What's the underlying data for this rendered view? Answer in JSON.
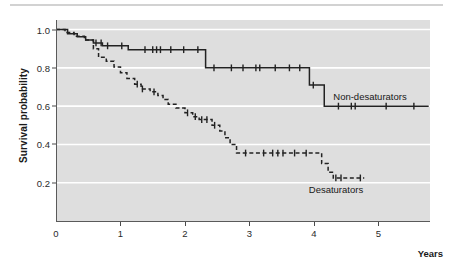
{
  "figure": {
    "axis_label_y": "Survival probability",
    "axis_label_x": "Years",
    "background_color": "#dedede",
    "gridline_color": "#ffffff",
    "curve_color": "#222222"
  },
  "ticks": {
    "y_labels": [
      "1.0",
      "0.8",
      "0.6",
      "0.4",
      "0.2"
    ],
    "x_labels": [
      "0",
      "1",
      "2",
      "3",
      "4",
      "5"
    ]
  },
  "annotations": {
    "non_desaturators": "Non-desaturators",
    "desaturators": "Desaturators"
  },
  "chart_data": {
    "type": "line",
    "title": "",
    "xlabel": "Years",
    "ylabel": "Survival probability",
    "xlim": [
      0,
      5.8
    ],
    "ylim": [
      0,
      1.05
    ],
    "grid": "horizontal",
    "y_ticks": [
      0.2,
      0.4,
      0.6,
      0.8,
      1.0
    ],
    "x_ticks": [
      0,
      1,
      2,
      3,
      4,
      5
    ],
    "legend_position": "inline-annotation",
    "series": [
      {
        "name": "Non-desaturators",
        "style": "solid",
        "steps": [
          [
            0.0,
            1.0
          ],
          [
            0.18,
            1.0
          ],
          [
            0.18,
            0.978
          ],
          [
            0.33,
            0.978
          ],
          [
            0.33,
            0.962
          ],
          [
            0.46,
            0.962
          ],
          [
            0.46,
            0.945
          ],
          [
            0.58,
            0.945
          ],
          [
            0.58,
            0.93
          ],
          [
            0.72,
            0.93
          ],
          [
            0.72,
            0.915
          ],
          [
            1.12,
            0.915
          ],
          [
            1.12,
            0.895
          ],
          [
            2.32,
            0.895
          ],
          [
            2.32,
            0.8
          ],
          [
            3.93,
            0.8
          ],
          [
            3.93,
            0.71
          ],
          [
            4.16,
            0.71
          ],
          [
            4.16,
            0.6
          ],
          [
            5.78,
            0.6
          ]
        ],
        "censor_marks": [
          [
            0.62,
            0.93
          ],
          [
            0.7,
            0.93
          ],
          [
            0.8,
            0.915
          ],
          [
            1.02,
            0.915
          ],
          [
            1.38,
            0.895
          ],
          [
            1.5,
            0.895
          ],
          [
            1.56,
            0.895
          ],
          [
            1.62,
            0.895
          ],
          [
            1.78,
            0.895
          ],
          [
            1.98,
            0.895
          ],
          [
            2.2,
            0.895
          ],
          [
            2.45,
            0.8
          ],
          [
            2.72,
            0.8
          ],
          [
            2.9,
            0.8
          ],
          [
            3.1,
            0.8
          ],
          [
            3.16,
            0.8
          ],
          [
            3.4,
            0.8
          ],
          [
            3.62,
            0.8
          ],
          [
            3.78,
            0.8
          ],
          [
            3.99,
            0.71
          ],
          [
            4.38,
            0.6
          ],
          [
            4.58,
            0.6
          ],
          [
            4.64,
            0.6
          ],
          [
            5.12,
            0.6
          ],
          [
            5.55,
            0.6
          ]
        ]
      },
      {
        "name": "Desaturators",
        "style": "dashed",
        "steps": [
          [
            0.0,
            1.0
          ],
          [
            0.14,
            1.0
          ],
          [
            0.14,
            0.985
          ],
          [
            0.28,
            0.985
          ],
          [
            0.28,
            0.965
          ],
          [
            0.44,
            0.965
          ],
          [
            0.44,
            0.945
          ],
          [
            0.58,
            0.945
          ],
          [
            0.58,
            0.9
          ],
          [
            0.66,
            0.9
          ],
          [
            0.66,
            0.855
          ],
          [
            0.78,
            0.855
          ],
          [
            0.78,
            0.835
          ],
          [
            0.9,
            0.835
          ],
          [
            0.9,
            0.805
          ],
          [
            1.0,
            0.805
          ],
          [
            1.0,
            0.775
          ],
          [
            1.1,
            0.775
          ],
          [
            1.1,
            0.745
          ],
          [
            1.22,
            0.745
          ],
          [
            1.22,
            0.715
          ],
          [
            1.32,
            0.715
          ],
          [
            1.32,
            0.69
          ],
          [
            1.46,
            0.69
          ],
          [
            1.46,
            0.675
          ],
          [
            1.58,
            0.675
          ],
          [
            1.58,
            0.655
          ],
          [
            1.66,
            0.655
          ],
          [
            1.66,
            0.635
          ],
          [
            1.74,
            0.635
          ],
          [
            1.74,
            0.61
          ],
          [
            1.86,
            0.61
          ],
          [
            1.86,
            0.59
          ],
          [
            2.0,
            0.59
          ],
          [
            2.0,
            0.565
          ],
          [
            2.12,
            0.565
          ],
          [
            2.12,
            0.545
          ],
          [
            2.22,
            0.545
          ],
          [
            2.22,
            0.53
          ],
          [
            2.42,
            0.53
          ],
          [
            2.42,
            0.5
          ],
          [
            2.54,
            0.5
          ],
          [
            2.54,
            0.47
          ],
          [
            2.62,
            0.47
          ],
          [
            2.62,
            0.435
          ],
          [
            2.7,
            0.435
          ],
          [
            2.7,
            0.4
          ],
          [
            2.8,
            0.4
          ],
          [
            2.8,
            0.355
          ],
          [
            4.12,
            0.355
          ],
          [
            4.12,
            0.3
          ],
          [
            4.22,
            0.3
          ],
          [
            4.22,
            0.255
          ],
          [
            4.3,
            0.255
          ],
          [
            4.3,
            0.225
          ],
          [
            4.78,
            0.225
          ]
        ],
        "censor_marks": [
          [
            1.26,
            0.715
          ],
          [
            1.34,
            0.69
          ],
          [
            1.52,
            0.675
          ],
          [
            2.04,
            0.565
          ],
          [
            2.16,
            0.545
          ],
          [
            2.26,
            0.53
          ],
          [
            2.34,
            0.53
          ],
          [
            2.46,
            0.5
          ],
          [
            2.94,
            0.355
          ],
          [
            3.22,
            0.355
          ],
          [
            3.36,
            0.355
          ],
          [
            3.44,
            0.355
          ],
          [
            3.52,
            0.355
          ],
          [
            3.7,
            0.355
          ],
          [
            3.88,
            0.355
          ],
          [
            4.34,
            0.225
          ],
          [
            4.42,
            0.225
          ],
          [
            4.72,
            0.225
          ]
        ]
      }
    ]
  }
}
